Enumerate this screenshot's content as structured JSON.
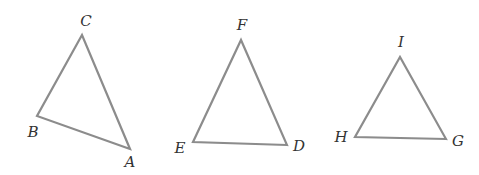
{
  "figure": {
    "width": 479,
    "height": 175,
    "stroke_color": "#8c8c8c",
    "label_color": "#333333",
    "background": "#ffffff"
  },
  "triangles": [
    {
      "name": "ABC",
      "vertices": [
        {
          "label": "A",
          "x": 130,
          "y": 149,
          "label_x": 130,
          "label_y": 163
        },
        {
          "label": "B",
          "x": 37,
          "y": 116,
          "label_x": 33,
          "label_y": 133
        },
        {
          "label": "C",
          "x": 82,
          "y": 35,
          "label_x": 86,
          "label_y": 22
        }
      ]
    },
    {
      "name": "DEF",
      "vertices": [
        {
          "label": "D",
          "x": 287,
          "y": 145,
          "label_x": 299,
          "label_y": 147
        },
        {
          "label": "E",
          "x": 193,
          "y": 142,
          "label_x": 180,
          "label_y": 149
        },
        {
          "label": "F",
          "x": 241,
          "y": 40,
          "label_x": 242,
          "label_y": 26
        }
      ]
    },
    {
      "name": "GHI",
      "vertices": [
        {
          "label": "G",
          "x": 446,
          "y": 139,
          "label_x": 458,
          "label_y": 142
        },
        {
          "label": "H",
          "x": 355,
          "y": 137,
          "label_x": 341,
          "label_y": 138
        },
        {
          "label": "I",
          "x": 400,
          "y": 57,
          "label_x": 401,
          "label_y": 43
        }
      ]
    }
  ]
}
